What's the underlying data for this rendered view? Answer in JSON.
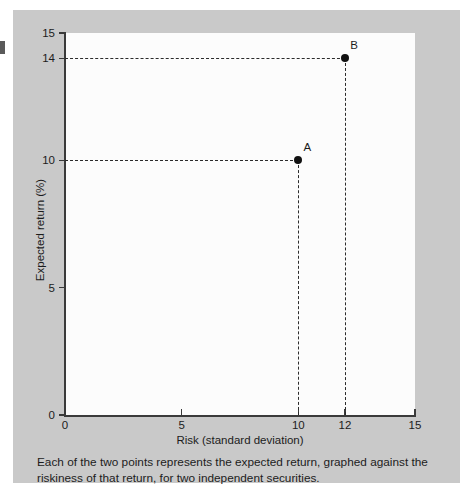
{
  "figure": {
    "caption": "Each of the two points represents the expected return, graphed against the riskiness of that return, for two independent securities.",
    "card_color": "#c9c9c9",
    "plot_background": "#fcfcfc",
    "axis_color": "#3a3a3a",
    "marker_color": "#111111",
    "guide_color": "#2b2b2b"
  },
  "chart_data": {
    "type": "scatter",
    "title": "",
    "subtitle": "",
    "xlabel": "Risk (standard deviation)",
    "ylabel": "Expected return (%)",
    "xlim": [
      0,
      15
    ],
    "ylim": [
      0,
      15
    ],
    "grid": false,
    "legend": "none",
    "x_ticks": [
      {
        "value": 0,
        "label": "0"
      },
      {
        "value": 5,
        "label": "5"
      },
      {
        "value": 10,
        "label": "10"
      },
      {
        "value": 12,
        "label": "12"
      },
      {
        "value": 15,
        "label": "15"
      }
    ],
    "y_ticks": [
      {
        "value": 0,
        "label": "0"
      },
      {
        "value": 5,
        "label": "5"
      },
      {
        "value": 10,
        "label": "10"
      },
      {
        "value": 14,
        "label": "14"
      },
      {
        "value": 15,
        "label": "15"
      }
    ],
    "points": [
      {
        "label": "A",
        "x": 10,
        "y": 10
      },
      {
        "label": "B",
        "x": 12,
        "y": 14
      }
    ],
    "guide_lines": [
      {
        "point": "A",
        "orientation": "horizontal",
        "value": 10
      },
      {
        "point": "A",
        "orientation": "vertical",
        "value": 10
      },
      {
        "point": "B",
        "orientation": "horizontal",
        "value": 14
      },
      {
        "point": "B",
        "orientation": "vertical",
        "value": 12
      }
    ],
    "annotations": []
  }
}
